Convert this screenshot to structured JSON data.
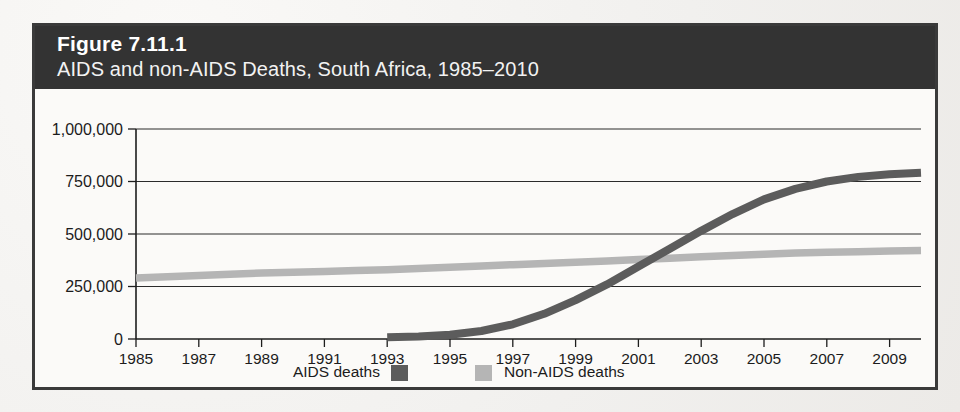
{
  "figure": {
    "number_label": "Figure 7.11.1",
    "title": "AIDS and non-AIDS Deaths, South Africa, 1985–2010",
    "header_background": "#333333",
    "frame_color": "#3a3a3a",
    "page_background": "#f3f2f0"
  },
  "legend": {
    "items": [
      {
        "label": "AIDS deaths",
        "color": "#5c5c5c",
        "swatch_position": "right-of-label"
      },
      {
        "label": "Non-AIDS deaths",
        "color": "#b5b5b5",
        "swatch_position": "left-of-label"
      }
    ]
  },
  "axes": {
    "y_ticks": [
      "0",
      "250,000",
      "500,000",
      "750,000",
      "1,000,000"
    ],
    "x_ticks": [
      "1985",
      "1987",
      "1989",
      "1991",
      "1993",
      "1995",
      "1997",
      "1999",
      "2001",
      "2003",
      "2005",
      "2007",
      "2009"
    ]
  },
  "chart_data": {
    "type": "line",
    "title": "AIDS and non-AIDS Deaths, South Africa, 1985–2010",
    "xlabel": "",
    "ylabel": "",
    "xlim": [
      1985,
      2010
    ],
    "ylim": [
      0,
      1000000
    ],
    "grid": true,
    "legend_position": "bottom-center",
    "y_tick_values": [
      0,
      250000,
      500000,
      750000,
      1000000
    ],
    "y_tick_labels": [
      "0",
      "250,000",
      "500,000",
      "750,000",
      "1,000,000"
    ],
    "x_tick_values": [
      1985,
      1987,
      1989,
      1991,
      1993,
      1995,
      1997,
      1999,
      2001,
      2003,
      2005,
      2007,
      2009
    ],
    "x_tick_labels": [
      "1985",
      "1987",
      "1989",
      "1991",
      "1993",
      "1995",
      "1997",
      "1999",
      "2001",
      "2003",
      "2005",
      "2007",
      "2009"
    ],
    "x": [
      1985,
      1986,
      1987,
      1988,
      1989,
      1990,
      1991,
      1992,
      1993,
      1994,
      1995,
      1996,
      1997,
      1998,
      1999,
      2000,
      2001,
      2002,
      2003,
      2004,
      2005,
      2006,
      2007,
      2008,
      2009,
      2010
    ],
    "series": [
      {
        "name": "Non-AIDS deaths",
        "color": "#b5b5b5",
        "values": [
          290000,
          296000,
          302000,
          308000,
          314000,
          318000,
          322000,
          326000,
          330000,
          336000,
          342000,
          348000,
          354000,
          360000,
          366000,
          372000,
          378000,
          385000,
          392000,
          398000,
          404000,
          409000,
          413000,
          416000,
          419000,
          421000
        ]
      },
      {
        "name": "AIDS deaths",
        "color": "#5c5c5c",
        "x_start": 1993,
        "values": [
          null,
          null,
          null,
          null,
          null,
          null,
          null,
          null,
          8000,
          12000,
          20000,
          38000,
          70000,
          120000,
          185000,
          260000,
          345000,
          430000,
          515000,
          595000,
          665000,
          715000,
          750000,
          772000,
          785000,
          792000
        ]
      }
    ],
    "annotations": [
      {
        "text": "AIDS deaths series begins in 1993 near zero",
        "x": 1993,
        "y": 8000
      },
      {
        "text": "Series cross at approximately 2002",
        "x": 2002,
        "y": 388000
      }
    ]
  }
}
